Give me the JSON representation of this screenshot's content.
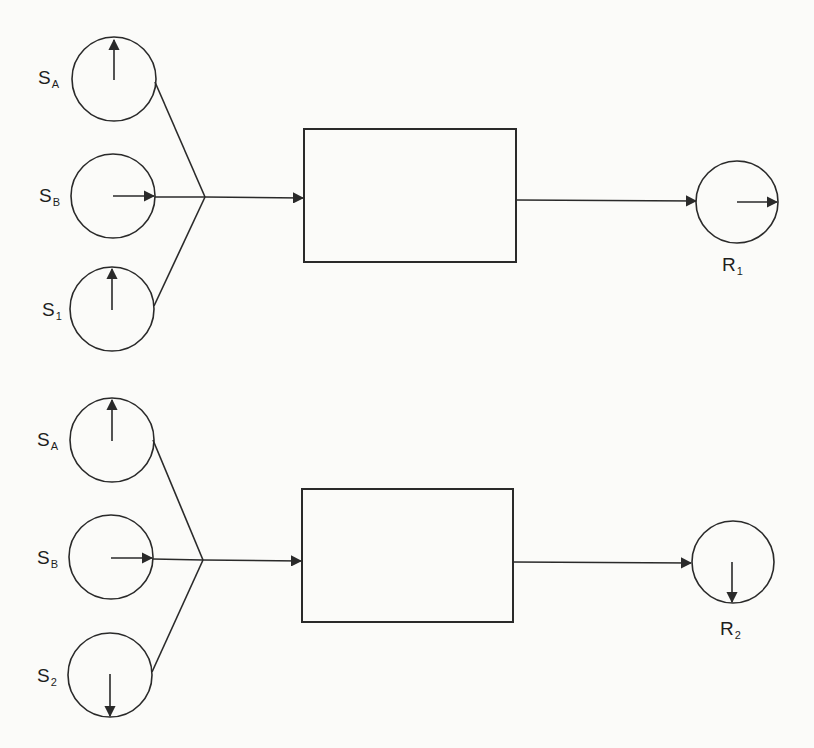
{
  "diagrams": [
    {
      "id": "top",
      "sources": [
        {
          "label": "S",
          "subscript": "A",
          "spin": "up"
        },
        {
          "label": "S",
          "subscript": "B",
          "spin": "right"
        },
        {
          "label": "S",
          "subscript": "1",
          "spin": "up"
        }
      ],
      "process_box": {
        "label": ""
      },
      "result": {
        "label": "R",
        "subscript": "1",
        "spin": "right"
      }
    },
    {
      "id": "bottom",
      "sources": [
        {
          "label": "S",
          "subscript": "A",
          "spin": "up"
        },
        {
          "label": "S",
          "subscript": "B",
          "spin": "right"
        },
        {
          "label": "S",
          "subscript": "2",
          "spin": "down"
        }
      ],
      "process_box": {
        "label": ""
      },
      "result": {
        "label": "R",
        "subscript": "2",
        "spin": "down"
      }
    }
  ],
  "colors": {
    "background": "#fbfbf9",
    "ink": "#2a2a2a"
  }
}
